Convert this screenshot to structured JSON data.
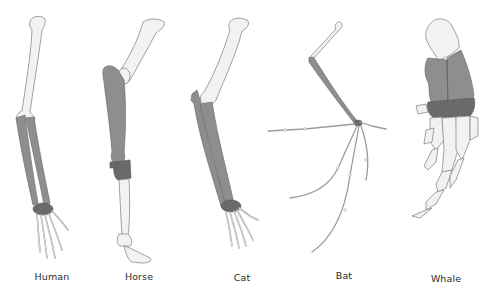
{
  "figure": {
    "colors": {
      "background": "#ffffff",
      "humerus_fill": "#f2f2f2",
      "radius_ulna_fill": "#8e8e8e",
      "carpals_fill": "#6a6a6a",
      "outline": "#8a8a8a",
      "label_text": "#2a2a2a"
    },
    "specimens": [
      {
        "name": "Human",
        "label_x": 52,
        "label_y": 278
      },
      {
        "name": "Horse",
        "label_x": 139,
        "label_y": 278
      },
      {
        "name": "Cat",
        "label_x": 242,
        "label_y": 279
      },
      {
        "name": "Bat",
        "label_x": 344,
        "label_y": 277
      },
      {
        "name": "Whale",
        "label_x": 446,
        "label_y": 280
      }
    ]
  }
}
